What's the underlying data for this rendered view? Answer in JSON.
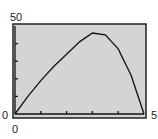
{
  "chart_data": {
    "type": "line",
    "title": "",
    "xlabel": "",
    "ylabel": "",
    "xlim": [
      0,
      5
    ],
    "ylim": [
      0,
      50
    ],
    "x_tick_labels": [
      "0",
      "5"
    ],
    "y_tick_labels": [
      "0",
      "50"
    ],
    "x_ticks": [
      1,
      2,
      3,
      4
    ],
    "y_ticks": [
      10,
      20,
      30,
      40
    ],
    "grid": false,
    "series": [
      {
        "name": "f(x)",
        "x": [
          0,
          0.5,
          1,
          1.5,
          2,
          2.5,
          3,
          3.5,
          4,
          4.5,
          5
        ],
        "y": [
          0,
          10,
          19,
          27,
          34,
          41,
          46,
          45,
          37,
          22,
          0
        ]
      }
    ]
  },
  "labels": {
    "ymax": "50",
    "ymin": "0",
    "xmin": "0",
    "xmax": "5"
  }
}
